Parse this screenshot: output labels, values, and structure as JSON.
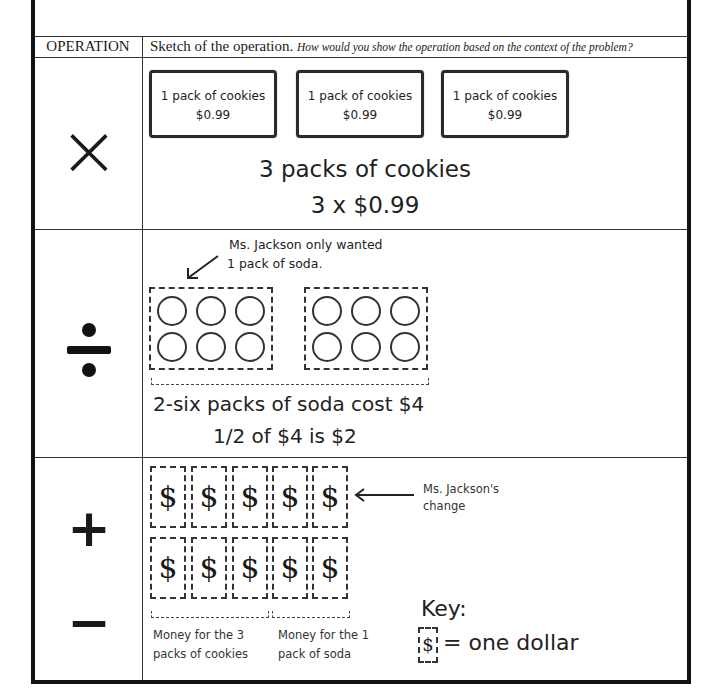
{
  "table": {
    "headers": {
      "operation": "OPERATION",
      "sketch_title": "Sketch of the operation.",
      "sketch_prompt": "How would you show the operation based on the context of the problem?"
    },
    "rows": [
      {
        "operation_symbol": "×",
        "operation_name": "multiply",
        "cookie_packs": [
          {
            "label": "1 pack of cookies",
            "price": "$0.99"
          },
          {
            "label": "1 pack of cookies",
            "price": "$0.99"
          },
          {
            "label": "1 pack of cookies",
            "price": "$0.99"
          }
        ],
        "caption_line1": "3 packs of cookies",
        "caption_line2": "3 x $0.99"
      },
      {
        "operation_symbol": "÷",
        "operation_name": "divide",
        "annotation_line1": "Ms. Jackson only wanted",
        "annotation_line2": "1 pack of soda.",
        "six_packs": 2,
        "cans_per_pack": 6,
        "caption_line1": "2-six packs of soda cost $4",
        "caption_line2": "1/2 of $4 is $2"
      },
      {
        "operation_symbol_plus": "+",
        "operation_symbol_minus": "−",
        "operation_name": "add-subtract",
        "bill_symbol": "$",
        "bill_rows": 2,
        "bills_per_row": 5,
        "change_label_line1": "Ms. Jackson's",
        "change_label_line2": "change",
        "bracket1_line1": "Money for the 3",
        "bracket1_line2": "packs of cookies",
        "bracket2_line1": "Money for the 1",
        "bracket2_line2": "pack of soda",
        "key_title": "Key:",
        "key_text": "= one dollar"
      }
    ]
  }
}
